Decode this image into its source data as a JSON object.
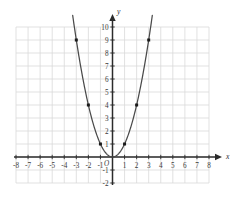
{
  "chart_data": {
    "type": "line",
    "title": "",
    "subtitle": "",
    "xlabel": "x",
    "ylabel": "y",
    "function": "y = x^2",
    "xlim": [
      -8,
      8
    ],
    "ylim": [
      -2,
      10
    ],
    "grid": true,
    "legend": null,
    "x_ticks": [
      -8,
      -7,
      -6,
      -5,
      -4,
      -3,
      -2,
      -1,
      1,
      2,
      3,
      4,
      5,
      6,
      7,
      8
    ],
    "x_tick_labels": [
      "-8",
      "-7",
      "-6",
      "-5",
      "-4",
      "-3",
      "-2",
      "-1",
      "1",
      "2",
      "3",
      "4",
      "5",
      "6",
      "7",
      "8"
    ],
    "y_ticks": [
      -2,
      -1,
      1,
      2,
      3,
      4,
      5,
      6,
      7,
      8,
      9,
      10
    ],
    "y_tick_labels": [
      "-2",
      "-1",
      "1",
      "2",
      "3",
      "4",
      "5",
      "6",
      "7",
      "8",
      "9",
      "10"
    ],
    "origin_label": "O",
    "series": [
      {
        "name": "y = x^2",
        "color": "#4a4a4a",
        "marker_color": "#1a1a1a",
        "points": [
          {
            "x": -3,
            "y": 9
          },
          {
            "x": -2,
            "y": 4
          },
          {
            "x": -1,
            "y": 1
          },
          {
            "x": 0,
            "y": 0
          },
          {
            "x": 1,
            "y": 1
          },
          {
            "x": 2,
            "y": 4
          },
          {
            "x": 3,
            "y": 9
          }
        ],
        "curve_x_range": [
          -3.3,
          3.3
        ]
      }
    ],
    "colors": {
      "grid": "#d9d9d9",
      "axis": "#2b2b2b",
      "curve": "#4a4a4a",
      "marker": "#1a1a1a",
      "background": "#ffffff",
      "tick_text": "#3a3a3a"
    }
  },
  "axis_labels": {
    "x": "x",
    "y": "y",
    "origin": "O"
  }
}
